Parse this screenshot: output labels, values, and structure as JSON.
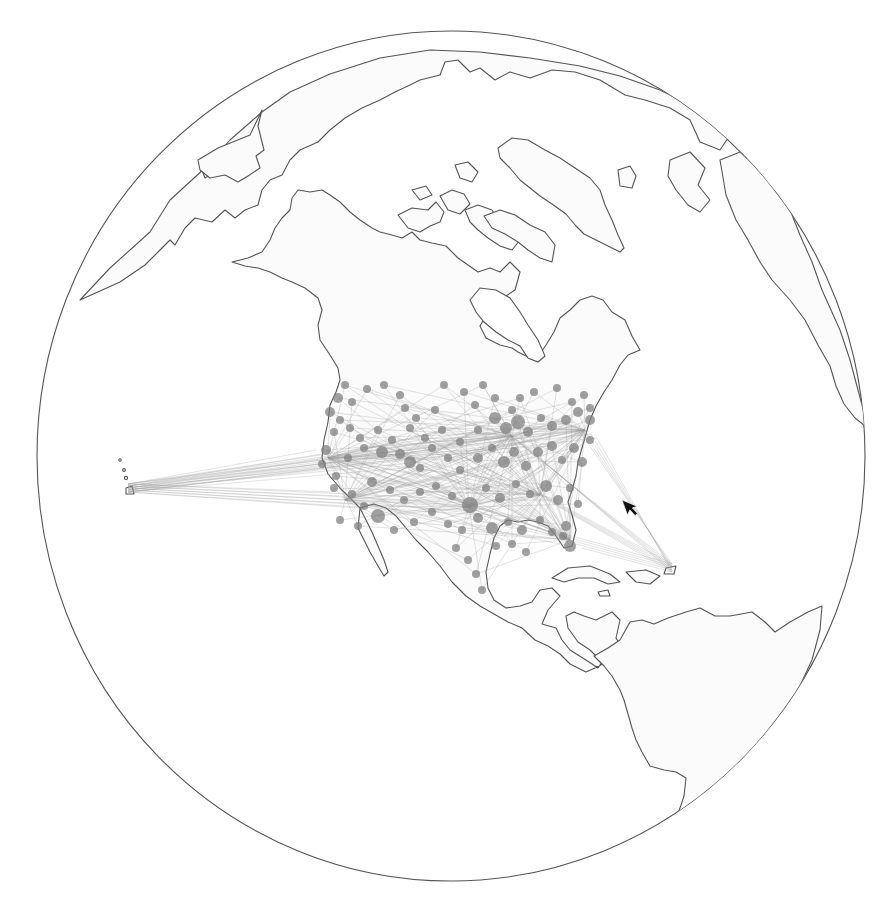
{
  "map": {
    "projection": "orthographic",
    "globe": {
      "cx": 451,
      "cy": 456,
      "rx": 414,
      "ry": 425
    },
    "colors": {
      "background": "#ffffff",
      "land_fill": "#fbfbfb",
      "coastline": "#555555",
      "route": "#9a9a9a",
      "airport": "#7d7d7d",
      "cursor": "#111111"
    },
    "layers": [
      "graticule-sphere",
      "land",
      "flight-routes",
      "airports"
    ],
    "hubs": [
      {
        "name": "west-coast-hub",
        "x": 328,
        "y": 458
      },
      {
        "name": "la-hub",
        "x": 345,
        "y": 500
      },
      {
        "name": "denver-hub",
        "x": 415,
        "y": 458
      },
      {
        "name": "dallas-hub",
        "x": 469,
        "y": 507
      },
      {
        "name": "chicago-hub",
        "x": 512,
        "y": 436
      },
      {
        "name": "atlanta-hub",
        "x": 540,
        "y": 495
      },
      {
        "name": "east-coast-hub",
        "x": 585,
        "y": 430
      },
      {
        "name": "florida-hub",
        "x": 570,
        "y": 540
      },
      {
        "name": "puerto-rico",
        "x": 672,
        "y": 568
      },
      {
        "name": "hawaii",
        "x": 128,
        "y": 488
      }
    ],
    "airports": [
      [
        345,
        385,
        4
      ],
      [
        338,
        398,
        5
      ],
      [
        352,
        402,
        4
      ],
      [
        367,
        389,
        4
      ],
      [
        384,
        385,
        4
      ],
      [
        400,
        395,
        4
      ],
      [
        405,
        408,
        4
      ],
      [
        416,
        418,
        4
      ],
      [
        435,
        410,
        4
      ],
      [
        444,
        385,
        4
      ],
      [
        464,
        392,
        4
      ],
      [
        475,
        405,
        4
      ],
      [
        483,
        385,
        4
      ],
      [
        495,
        398,
        4
      ],
      [
        512,
        410,
        4
      ],
      [
        520,
        398,
        4
      ],
      [
        534,
        392,
        4
      ],
      [
        557,
        388,
        4
      ],
      [
        572,
        402,
        4
      ],
      [
        584,
        395,
        4
      ],
      [
        590,
        408,
        4
      ],
      [
        330,
        412,
        5
      ],
      [
        340,
        420,
        4
      ],
      [
        334,
        432,
        4
      ],
      [
        350,
        428,
        4
      ],
      [
        360,
        438,
        4
      ],
      [
        378,
        430,
        4
      ],
      [
        392,
        440,
        4
      ],
      [
        410,
        428,
        4
      ],
      [
        425,
        438,
        4
      ],
      [
        442,
        430,
        4
      ],
      [
        460,
        442,
        4
      ],
      [
        478,
        430,
        4
      ],
      [
        495,
        418,
        6
      ],
      [
        506,
        428,
        6
      ],
      [
        518,
        422,
        7
      ],
      [
        528,
        432,
        5
      ],
      [
        541,
        418,
        4
      ],
      [
        552,
        426,
        5
      ],
      [
        566,
        420,
        5
      ],
      [
        578,
        412,
        5
      ],
      [
        590,
        420,
        5
      ],
      [
        326,
        450,
        5
      ],
      [
        322,
        464,
        4
      ],
      [
        336,
        476,
        4
      ],
      [
        348,
        458,
        4
      ],
      [
        364,
        448,
        4
      ],
      [
        382,
        452,
        6
      ],
      [
        400,
        454,
        5
      ],
      [
        410,
        462,
        6
      ],
      [
        420,
        468,
        4
      ],
      [
        432,
        448,
        4
      ],
      [
        448,
        458,
        4
      ],
      [
        460,
        470,
        4
      ],
      [
        478,
        458,
        5
      ],
      [
        492,
        448,
        4
      ],
      [
        504,
        462,
        6
      ],
      [
        514,
        452,
        5
      ],
      [
        526,
        466,
        5
      ],
      [
        538,
        452,
        5
      ],
      [
        552,
        446,
        5
      ],
      [
        562,
        460,
        4
      ],
      [
        574,
        448,
        5
      ],
      [
        582,
        462,
        5
      ],
      [
        590,
        440,
        4
      ],
      [
        334,
        488,
        4
      ],
      [
        352,
        494,
        4
      ],
      [
        364,
        506,
        4
      ],
      [
        372,
        482,
        5
      ],
      [
        390,
        490,
        4
      ],
      [
        404,
        500,
        4
      ],
      [
        420,
        492,
        4
      ],
      [
        436,
        486,
        4
      ],
      [
        452,
        496,
        4
      ],
      [
        470,
        505,
        8
      ],
      [
        486,
        488,
        4
      ],
      [
        500,
        498,
        5
      ],
      [
        516,
        484,
        4
      ],
      [
        530,
        494,
        4
      ],
      [
        546,
        486,
        6
      ],
      [
        558,
        500,
        5
      ],
      [
        570,
        488,
        4
      ],
      [
        578,
        504,
        4
      ],
      [
        340,
        520,
        4
      ],
      [
        358,
        526,
        4
      ],
      [
        378,
        516,
        7
      ],
      [
        394,
        530,
        4
      ],
      [
        414,
        522,
        4
      ],
      [
        432,
        512,
        4
      ],
      [
        448,
        524,
        4
      ],
      [
        462,
        530,
        4
      ],
      [
        478,
        518,
        5
      ],
      [
        492,
        528,
        6
      ],
      [
        508,
        522,
        4
      ],
      [
        522,
        530,
        5
      ],
      [
        540,
        520,
        4
      ],
      [
        552,
        532,
        4
      ],
      [
        566,
        526,
        5
      ],
      [
        570,
        546,
        6
      ],
      [
        563,
        536,
        4
      ],
      [
        456,
        548,
        4
      ],
      [
        468,
        560,
        4
      ],
      [
        476,
        574,
        4
      ],
      [
        482,
        590,
        4
      ],
      [
        496,
        546,
        4
      ],
      [
        512,
        544,
        4
      ],
      [
        526,
        552,
        4
      ]
    ],
    "routes_fan_origins": [
      "west-coast-hub",
      "la-hub",
      "dallas-hub",
      "chicago-hub",
      "atlanta-hub",
      "east-coast-hub",
      "florida-hub"
    ],
    "long_routes": [
      {
        "from": "hawaii",
        "to": "west-coast-hub"
      },
      {
        "from": "hawaii",
        "to": "la-hub"
      },
      {
        "from": "hawaii",
        "to": "denver-hub"
      },
      {
        "from": "hawaii",
        "to": "chicago-hub"
      },
      {
        "from": "hawaii",
        "to": "dallas-hub"
      },
      {
        "from": "hawaii",
        "to": "east-coast-hub"
      },
      {
        "from": "puerto-rico",
        "to": "east-coast-hub"
      },
      {
        "from": "puerto-rico",
        "to": "florida-hub"
      },
      {
        "from": "puerto-rico",
        "to": "atlanta-hub"
      },
      {
        "from": "puerto-rico",
        "to": "chicago-hub"
      }
    ],
    "cursor": {
      "x": 622,
      "y": 500,
      "type": "arrow"
    }
  }
}
